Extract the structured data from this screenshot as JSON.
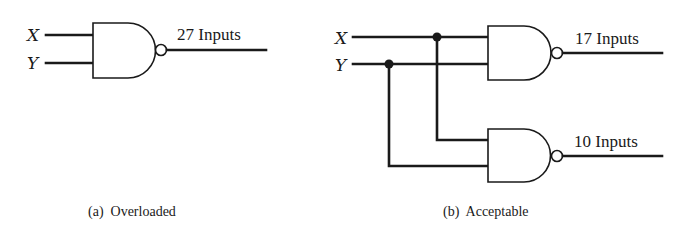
{
  "diagram": {
    "colors": {
      "ink": "#1a1a1a",
      "background": "#ffffff"
    },
    "part_a": {
      "caption": "(a)  Overloaded",
      "inputs": [
        {
          "label": "X"
        },
        {
          "label": "Y"
        }
      ],
      "gate": {
        "type": "NAND"
      },
      "output_label": "27 Inputs"
    },
    "part_b": {
      "caption": "(b)  Acceptable",
      "inputs": [
        {
          "label": "X"
        },
        {
          "label": "Y"
        }
      ],
      "gates": [
        {
          "type": "NAND",
          "output_label": "17 Inputs"
        },
        {
          "type": "NAND",
          "output_label": "10 Inputs"
        }
      ]
    }
  }
}
